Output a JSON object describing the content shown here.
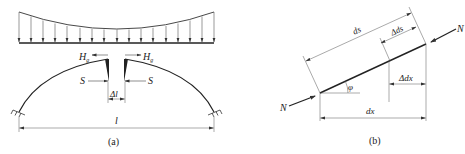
{
  "figure_a": {
    "caption": "(a)",
    "load_type": "distributed load, larger at ends, smaller at crown",
    "labels": {
      "Hg_left": "H",
      "Hg_left_sub": "g",
      "Hg_right": "H",
      "Hg_right_sub": "g",
      "S_left": "S",
      "S_right": "S",
      "delta_l": "Δl",
      "span": "l"
    }
  },
  "figure_b": {
    "caption": "(b)",
    "labels": {
      "ds": "ds",
      "delta_ds": "Δds",
      "dx": "dx",
      "delta_dx": "Δdx",
      "phi": "φ",
      "N_left": "N",
      "N_right": "N"
    }
  },
  "colors": {
    "line": "#222222",
    "thin_line": "#555555",
    "background": "#ffffff"
  }
}
